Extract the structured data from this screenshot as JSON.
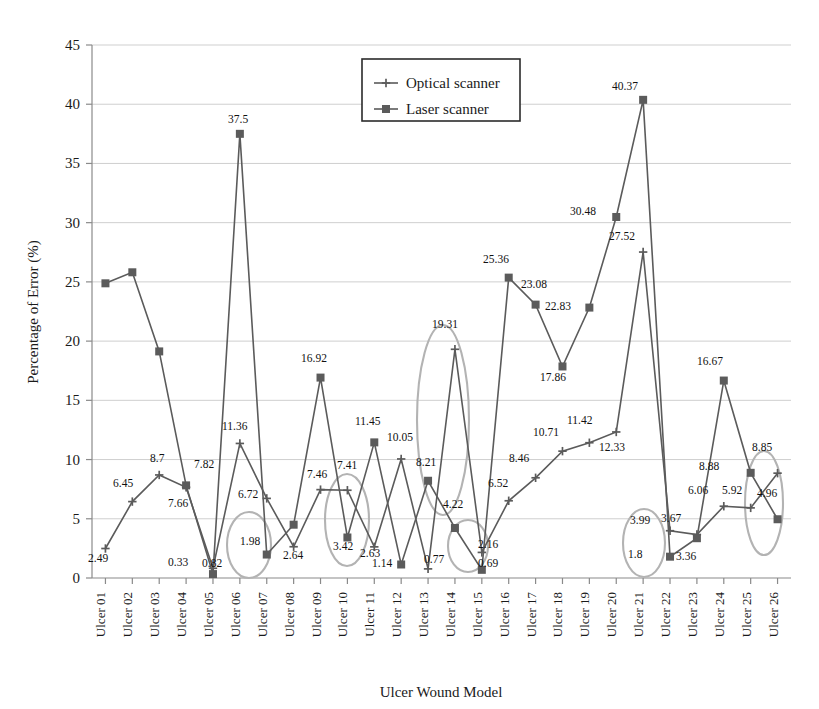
{
  "chart_data": {
    "type": "line",
    "title": "",
    "xlabel": "Ulcer Wound Model",
    "ylabel": "Percentage of Error (%)",
    "ylim": [
      0,
      45
    ],
    "yticks": [
      0,
      5,
      10,
      15,
      20,
      25,
      30,
      35,
      40,
      45
    ],
    "grid": true,
    "legend_position": "top-center-right",
    "categories": [
      "Ulcer 01",
      "Ulcer 02",
      "Ulcer 03",
      "Ulcer 04",
      "Ulcer 05",
      "Ulcer 06",
      "Ulcer 07",
      "Ulcer 08",
      "Ulcer 09",
      "Ulcer 10",
      "Ulcer 11",
      "Ulcer 12",
      "Ulcer 13",
      "Ulcer 14",
      "Ulcer 15",
      "Ulcer 16",
      "Ulcer 17",
      "Ulcer 18",
      "Ulcer 19",
      "Ulcer 20",
      "Ulcer 21",
      "Ulcer 22",
      "Ulcer 23",
      "Ulcer 24",
      "Ulcer 25",
      "Ulcer 26"
    ],
    "series": [
      {
        "name": "Optical scanner",
        "marker": "cross",
        "values": [
          2.49,
          6.45,
          8.7,
          7.66,
          0.82,
          11.36,
          6.72,
          2.64,
          7.46,
          7.41,
          2.63,
          10.05,
          0.77,
          19.31,
          2.16,
          6.52,
          8.46,
          10.71,
          11.42,
          12.33,
          27.52,
          3.99,
          3.67,
          6.06,
          5.92,
          8.85
        ]
      },
      {
        "name": "Laser scanner",
        "marker": "square",
        "values": [
          24.88,
          25.81,
          19.13,
          7.82,
          0.33,
          37.5,
          1.98,
          4.5,
          16.92,
          3.42,
          11.45,
          1.14,
          8.21,
          4.22,
          0.69,
          25.36,
          23.08,
          17.86,
          22.83,
          30.48,
          40.37,
          1.8,
          3.36,
          16.67,
          8.88,
          4.96
        ]
      }
    ],
    "data_labels": [
      {
        "text": "2.49",
        "x": 88,
        "y": 562
      },
      {
        "text": "6.45",
        "x": 113,
        "y": 487
      },
      {
        "text": "8.7",
        "x": 150,
        "y": 462
      },
      {
        "text": "7.66",
        "x": 168,
        "y": 507
      },
      {
        "text": "0.33",
        "x": 168,
        "y": 566
      },
      {
        "text": "7.82",
        "x": 194,
        "y": 468
      },
      {
        "text": "0.82",
        "x": 202,
        "y": 567
      },
      {
        "text": "37.5",
        "x": 228,
        "y": 123
      },
      {
        "text": "11.36",
        "x": 222,
        "y": 430
      },
      {
        "text": "6.72",
        "x": 238,
        "y": 498
      },
      {
        "text": "1.98",
        "x": 240,
        "y": 545
      },
      {
        "text": "2.64",
        "x": 283,
        "y": 559
      },
      {
        "text": "16.92",
        "x": 301,
        "y": 362
      },
      {
        "text": "7.46",
        "x": 307,
        "y": 478
      },
      {
        "text": "7.41",
        "x": 337,
        "y": 469
      },
      {
        "text": "3.42",
        "x": 333,
        "y": 550
      },
      {
        "text": "11.45",
        "x": 355,
        "y": 425
      },
      {
        "text": "2.63",
        "x": 360,
        "y": 557
      },
      {
        "text": "1.14",
        "x": 372,
        "y": 567
      },
      {
        "text": "10.05",
        "x": 387,
        "y": 441
      },
      {
        "text": "8.21",
        "x": 416,
        "y": 466
      },
      {
        "text": "0.77",
        "x": 424,
        "y": 563
      },
      {
        "text": "19.31",
        "x": 432,
        "y": 328
      },
      {
        "text": "4.22",
        "x": 443,
        "y": 508
      },
      {
        "text": "2.16",
        "x": 478,
        "y": 548
      },
      {
        "text": "0.69",
        "x": 478,
        "y": 567
      },
      {
        "text": "25.36",
        "x": 483,
        "y": 263
      },
      {
        "text": "6.52",
        "x": 488,
        "y": 487
      },
      {
        "text": "8.46",
        "x": 509,
        "y": 462
      },
      {
        "text": "23.08",
        "x": 521,
        "y": 288
      },
      {
        "text": "22.83",
        "x": 545,
        "y": 310
      },
      {
        "text": "17.86",
        "x": 540,
        "y": 381
      },
      {
        "text": "10.71",
        "x": 533,
        "y": 436
      },
      {
        "text": "11.42",
        "x": 567,
        "y": 424
      },
      {
        "text": "30.48",
        "x": 570,
        "y": 215
      },
      {
        "text": "12.33",
        "x": 599,
        "y": 451
      },
      {
        "text": "27.52",
        "x": 609,
        "y": 240
      },
      {
        "text": "40.37",
        "x": 612,
        "y": 90
      },
      {
        "text": "3.99",
        "x": 630,
        "y": 524
      },
      {
        "text": "1.8",
        "x": 628,
        "y": 558
      },
      {
        "text": "3.67",
        "x": 661,
        "y": 522
      },
      {
        "text": "3.36",
        "x": 676,
        "y": 560
      },
      {
        "text": "16.67",
        "x": 697,
        "y": 365
      },
      {
        "text": "6.06",
        "x": 688,
        "y": 494
      },
      {
        "text": "5.92",
        "x": 722,
        "y": 494
      },
      {
        "text": "8.88",
        "x": 699,
        "y": 470
      },
      {
        "text": "8.85",
        "x": 752,
        "y": 451
      },
      {
        "text": "4.96",
        "x": 757,
        "y": 497
      }
    ],
    "annotations": [
      {
        "name": "highlight-ellipse-ulcer07",
        "cx": 249,
        "cy": 545,
        "rx": 22,
        "ry": 33,
        "rotate": 0
      },
      {
        "name": "highlight-ellipse-ulcer11",
        "cx": 347,
        "cy": 520,
        "rx": 22,
        "ry": 46,
        "rotate": 0
      },
      {
        "name": "highlight-ellipse-ulcer14",
        "cx": 443,
        "cy": 420,
        "rx": 26,
        "ry": 95,
        "rotate": 0
      },
      {
        "name": "highlight-ellipse-ulcer15",
        "cx": 468,
        "cy": 546,
        "rx": 20,
        "ry": 26,
        "rotate": 0
      },
      {
        "name": "highlight-ellipse-ulcer22",
        "cx": 644,
        "cy": 543,
        "rx": 21,
        "ry": 34,
        "rotate": 0
      },
      {
        "name": "highlight-ellipse-ulcer26",
        "cx": 764,
        "cy": 503,
        "rx": 19,
        "ry": 52,
        "rotate": 0
      }
    ]
  },
  "legend": {
    "items": [
      {
        "label": "Optical scanner",
        "marker": "cross"
      },
      {
        "label": "Laser scanner",
        "marker": "square"
      }
    ]
  },
  "colors": {
    "series": "#5b5b5b",
    "grid": "#cfcfcf",
    "axis": "#8a8a8a",
    "annotation": "#b3b3b3",
    "text": "#1a1a1a",
    "background": "#ffffff"
  }
}
